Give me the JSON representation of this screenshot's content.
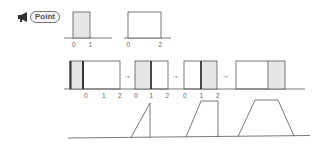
{
  "badge": {
    "label": "Point",
    "icon": "megaphone-icon"
  },
  "colors": {
    "line": "#555555",
    "shade": "#e6e6e6",
    "bold_line": "#333333"
  },
  "row1": {
    "panels": [
      {
        "ticks": [
          "0",
          "1"
        ]
      },
      {
        "ticks": [
          "0",
          "2"
        ]
      }
    ]
  },
  "row2": {
    "groups": [
      {
        "ticks": [
          "0",
          "1",
          "2"
        ]
      },
      {
        "ticks": [
          "0",
          "1",
          "2"
        ]
      },
      {
        "ticks": [
          "0",
          "1",
          "2"
        ]
      },
      {
        "ticks": []
      }
    ],
    "arrow": "→"
  },
  "row3": {
    "shapes": [
      "triangle",
      "trapezoid",
      "trapezoid-wide"
    ]
  }
}
